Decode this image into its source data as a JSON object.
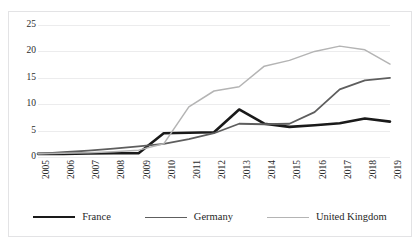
{
  "chart": {
    "title": "",
    "border_color": "#e3e3e5",
    "grid_color": "#ececed",
    "background": "#ffffff"
  },
  "axes": {
    "y_ticks": [
      "0",
      "5",
      "10",
      "15",
      "20",
      "25"
    ],
    "x_ticks": [
      "2005",
      "2006",
      "2007",
      "2008",
      "2009",
      "2010",
      "2011",
      "2012",
      "2013",
      "2014",
      "2015",
      "2016",
      "2017",
      "2018",
      "2019"
    ]
  },
  "legend": {
    "items": [
      {
        "label": "France",
        "color": "#1a1a1a",
        "width": 2.6
      },
      {
        "label": "Germany",
        "color": "#5e5e5e",
        "width": 1.8
      },
      {
        "label": "United Kingdom",
        "color": "#b4b4b4",
        "width": 1.5
      }
    ]
  },
  "chart_data": {
    "type": "line",
    "title": "",
    "xlabel": "",
    "ylabel": "",
    "xlim": [
      2005,
      2019
    ],
    "ylim": [
      0,
      25
    ],
    "y_tick_step": 5,
    "grid": "horizontal",
    "legend_position": "bottom",
    "categories": [
      2005,
      2006,
      2007,
      2008,
      2009,
      2010,
      2011,
      2012,
      2013,
      2014,
      2015,
      2016,
      2017,
      2018,
      2019
    ],
    "series": [
      {
        "name": "France",
        "color": "#1a1a1a",
        "line_width": 2.6,
        "values": [
          0.6,
          0.6,
          0.65,
          0.7,
          0.7,
          4.5,
          4.6,
          4.7,
          9.0,
          6.3,
          5.7,
          6.0,
          6.4,
          7.3,
          6.7
        ]
      },
      {
        "name": "Germany",
        "color": "#5e5e5e",
        "line_width": 1.8,
        "values": [
          0.6,
          0.9,
          1.2,
          1.6,
          2.0,
          2.5,
          3.4,
          4.5,
          6.3,
          6.2,
          6.3,
          8.5,
          12.8,
          14.5,
          15.0
        ]
      },
      {
        "name": "United Kingdom",
        "color": "#b4b4b4",
        "line_width": 1.5,
        "values": [
          0.6,
          0.7,
          0.8,
          1.0,
          1.3,
          2.5,
          9.5,
          12.5,
          13.3,
          17.2,
          18.3,
          20.0,
          21.0,
          20.3,
          17.6
        ]
      }
    ]
  }
}
